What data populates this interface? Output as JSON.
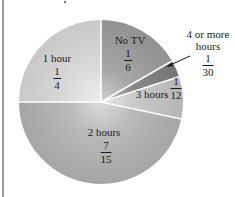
{
  "chart_data": {
    "type": "pie",
    "title": "",
    "start_angle_deg": 0,
    "direction": "clockwise",
    "slices": [
      {
        "label": "No TV",
        "fraction": "1/6",
        "numerator": "1",
        "denominator": "6",
        "value": 0.1667,
        "color": "#9c9c9c"
      },
      {
        "label": "4 or more hours",
        "fraction": "1/30",
        "numerator": "1",
        "denominator": "30",
        "value": 0.0333,
        "color": "#7c7c7c"
      },
      {
        "label": "3 hours",
        "fraction": "1/12",
        "numerator": "1",
        "denominator": "12",
        "value": 0.0833,
        "color": "#c4c4c4"
      },
      {
        "label": "2 hours",
        "fraction": "7/15",
        "numerator": "7",
        "denominator": "15",
        "value": 0.4667,
        "color": "#b2b2b2"
      },
      {
        "label": "1 hour",
        "fraction": "1/4",
        "numerator": "1",
        "denominator": "4",
        "value": 0.25,
        "color": "#d8d8d8"
      }
    ],
    "legend": "none",
    "annotations": [
      "leader line for 4 or more hours slice"
    ]
  },
  "labels": {
    "no_tv": {
      "name": "No TV",
      "num": "1",
      "den": "6"
    },
    "four_plus": {
      "name_line1": "4 or more",
      "name_line2": "hours",
      "num": "1",
      "den": "30"
    },
    "three_hours": {
      "name": "3 hours",
      "num": "1",
      "den": "12"
    },
    "two_hours": {
      "name": "2 hours",
      "num": "7",
      "den": "15"
    },
    "one_hour": {
      "name": "1 hour",
      "num": "1",
      "den": "4"
    }
  }
}
